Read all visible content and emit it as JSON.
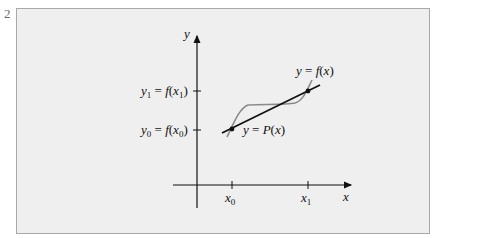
{
  "figure": {
    "edge_mark": "2",
    "axes": {
      "x_label": "x",
      "y_label": "y",
      "x_ticks": [
        "x0",
        "x1"
      ],
      "y_ticks": [
        "y0 = f(x0)",
        "y1 = f(x1)"
      ]
    },
    "curves": [
      {
        "name": "function",
        "label": "y = f(x)",
        "color": "#8a8a8a"
      },
      {
        "name": "linear-interpolant",
        "label": "y = P(x)",
        "color": "#111111"
      }
    ],
    "points": [
      {
        "name": "P0",
        "x": "x0",
        "y": "y0"
      },
      {
        "name": "P1",
        "x": "x1",
        "y": "y1"
      }
    ],
    "colors": {
      "panel_bg": "#efefef",
      "panel_border": "#a9a9a9",
      "ink": "#111111",
      "curve_gray": "#8a8a8a"
    }
  }
}
